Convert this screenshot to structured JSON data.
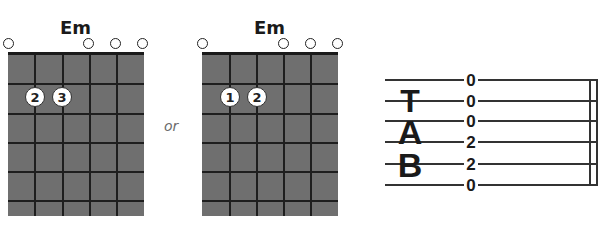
{
  "chords": [
    {
      "name": "Em",
      "open_strings_marker": "O",
      "fingers": [
        {
          "label": "2",
          "string": 5,
          "fret": 2
        },
        {
          "label": "3",
          "string": 4,
          "fret": 2
        }
      ]
    },
    {
      "name": "Em",
      "open_strings_marker": "O",
      "fingers": [
        {
          "label": "1",
          "string": 5,
          "fret": 2
        },
        {
          "label": "2",
          "string": 4,
          "fret": 2
        }
      ]
    }
  ],
  "separator": "or",
  "tab": {
    "letters": [
      "T",
      "A",
      "B"
    ],
    "strings": [
      "0",
      "0",
      "0",
      "2",
      "2",
      "0"
    ]
  },
  "colors": {
    "grid_fill": "#6f6f6f",
    "grid_lines": "#1e1e1e",
    "finger_fill": "#ffffff",
    "text": "#1a1a1a"
  }
}
